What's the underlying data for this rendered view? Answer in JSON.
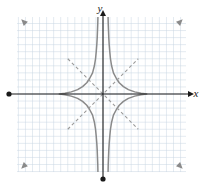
{
  "figure": {
    "kind": "coordinate-graph",
    "title": "",
    "width": 202,
    "height": 186,
    "background_color": "#ffffff"
  },
  "axes": {
    "x_label": "x",
    "y_label": "y",
    "axis_color": "#1a1a1a",
    "origin_px": {
      "x": 103,
      "y": 94
    },
    "x_axis_px": {
      "x1": 9,
      "x2": 194,
      "y": 94
    },
    "y_axis_px": {
      "x": 103,
      "y1": 10,
      "y2": 179
    },
    "x_arrow_end": "right",
    "y_arrow_end": "top",
    "x_dot_end": "left",
    "y_dot_end": "bottom"
  },
  "grid": {
    "color": "#c9d6e2",
    "cell_px": 7.05,
    "left_px": 17,
    "right_px": 186,
    "top_px": 17,
    "bottom_px": 172,
    "visible": true
  },
  "chart_data": {
    "type": "line",
    "title": "",
    "xlabel": "x",
    "ylabel": "y",
    "grid": true,
    "legend": false,
    "xlim": [
      -12.2,
      11.8
    ],
    "ylim": [
      -11.0,
      10.9
    ],
    "pixels_per_unit": 7.05,
    "curves": [
      {
        "name": "hyperbola-right-branch",
        "style": "solid",
        "color": "#8a8a8a",
        "equation": "x^2/0.5^2 - y^2/0.5^2 = 1",
        "points": [
          [
            0.72,
            -11.0
          ],
          [
            0.74,
            -10.0
          ],
          [
            0.78,
            -9.0
          ],
          [
            0.82,
            -8.0
          ],
          [
            0.88,
            -7.0
          ],
          [
            0.96,
            -6.0
          ],
          [
            1.06,
            -5.0
          ],
          [
            1.22,
            -4.0
          ],
          [
            1.48,
            -3.0
          ],
          [
            1.9,
            -2.2
          ],
          [
            2.3,
            -1.6
          ],
          [
            2.9,
            -1.05
          ],
          [
            3.6,
            -0.62
          ],
          [
            4.5,
            -0.3
          ],
          [
            5.4,
            -0.1
          ],
          [
            6.2,
            0.0
          ],
          [
            5.4,
            0.1
          ],
          [
            4.5,
            0.3
          ],
          [
            3.6,
            0.62
          ],
          [
            2.9,
            1.05
          ],
          [
            2.3,
            1.6
          ],
          [
            1.9,
            2.2
          ],
          [
            1.48,
            3.0
          ],
          [
            1.22,
            4.0
          ],
          [
            1.06,
            5.0
          ],
          [
            0.96,
            6.0
          ],
          [
            0.88,
            7.0
          ],
          [
            0.82,
            8.0
          ],
          [
            0.78,
            9.0
          ],
          [
            0.74,
            10.0
          ],
          [
            0.72,
            10.9
          ]
        ]
      },
      {
        "name": "hyperbola-left-branch",
        "style": "solid",
        "color": "#8a8a8a",
        "equation": "x^2/0.5^2 - y^2/0.5^2 = 1",
        "points": [
          [
            -0.72,
            -11.0
          ],
          [
            -0.74,
            -10.0
          ],
          [
            -0.78,
            -9.0
          ],
          [
            -0.82,
            -8.0
          ],
          [
            -0.88,
            -7.0
          ],
          [
            -0.96,
            -6.0
          ],
          [
            -1.06,
            -5.0
          ],
          [
            -1.22,
            -4.0
          ],
          [
            -1.48,
            -3.0
          ],
          [
            -1.9,
            -2.2
          ],
          [
            -2.3,
            -1.6
          ],
          [
            -2.9,
            -1.05
          ],
          [
            -3.6,
            -0.62
          ],
          [
            -4.5,
            -0.3
          ],
          [
            -5.4,
            -0.1
          ],
          [
            -6.2,
            0.0
          ],
          [
            -5.4,
            0.1
          ],
          [
            -4.5,
            0.3
          ],
          [
            -3.6,
            0.62
          ],
          [
            -2.9,
            1.05
          ],
          [
            -2.3,
            1.6
          ],
          [
            -1.9,
            2.2
          ],
          [
            -1.48,
            3.0
          ],
          [
            -1.22,
            4.0
          ],
          [
            -1.06,
            5.0
          ],
          [
            -0.96,
            6.0
          ],
          [
            -0.88,
            7.0
          ],
          [
            -0.82,
            8.0
          ],
          [
            -0.78,
            9.0
          ],
          [
            -0.74,
            10.0
          ],
          [
            -0.72,
            10.9
          ]
        ]
      }
    ],
    "asymptotes": [
      {
        "name": "asymptote-positive-slope",
        "style": "dashed",
        "color": "#9a9a9a",
        "equation": "y = x",
        "from": [
          -5.0,
          -5.0
        ],
        "to": [
          5.0,
          5.0
        ]
      },
      {
        "name": "asymptote-negative-slope",
        "style": "dashed",
        "color": "#9a9a9a",
        "equation": "y = -x",
        "from": [
          -5.0,
          5.0
        ],
        "to": [
          5.0,
          -5.0
        ]
      }
    ],
    "arrowheads": [
      {
        "name": "arrow-upper-left",
        "at": [
          -11.6,
          10.6
        ],
        "direction": "up-left"
      },
      {
        "name": "arrow-upper-right",
        "at": [
          11.3,
          10.6
        ],
        "direction": "up-right"
      },
      {
        "name": "arrow-lower-left",
        "at": [
          -11.6,
          -10.6
        ],
        "direction": "down-left"
      },
      {
        "name": "arrow-lower-right",
        "at": [
          11.3,
          -10.6
        ],
        "direction": "down-right"
      }
    ]
  }
}
